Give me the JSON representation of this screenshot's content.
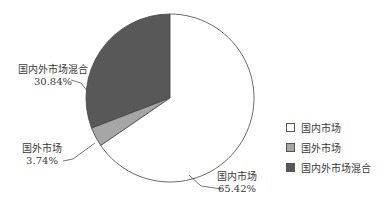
{
  "chart_data": {
    "type": "pie",
    "title": "",
    "categories": [
      "国内市场",
      "国外市场",
      "国内外市场混合"
    ],
    "values": [
      65.42,
      3.74,
      30.84
    ],
    "unit": "%",
    "colors": [
      "#ffffff",
      "#a6a6a6",
      "#585858"
    ],
    "legend_position": "right",
    "start_angle_deg": 90,
    "direction": "counterclockwise_from_top_for_mixed",
    "labels": [
      {
        "name": "国内市场",
        "pct": "65.42%"
      },
      {
        "name": "国外市场",
        "pct": "3.74%"
      },
      {
        "name": "国内外市场混合",
        "pct": "30.84%"
      }
    ]
  },
  "labels": {
    "mixed_name": "国内外市场混合",
    "mixed_pct": "30.84%",
    "foreign_name": "国外市场",
    "foreign_pct": "3.74%",
    "domestic_name": "国内市场",
    "domestic_pct": "65.42%"
  },
  "legend": {
    "items": [
      {
        "label": "国内市场",
        "color": "#ffffff"
      },
      {
        "label": "国外市场",
        "color": "#a6a6a6"
      },
      {
        "label": "国内外市场混合",
        "color": "#585858"
      }
    ]
  }
}
